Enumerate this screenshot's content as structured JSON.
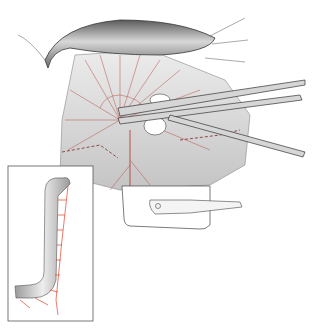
{
  "figure": {
    "type": "surgical-illustration",
    "colors": {
      "vessel": "#b5524a",
      "vessel_inset": "#e0442a",
      "tissue": "#d9d9d9",
      "bowel": "#8a8a8a",
      "outline": "#333333"
    },
    "inset": {
      "present": true
    }
  }
}
